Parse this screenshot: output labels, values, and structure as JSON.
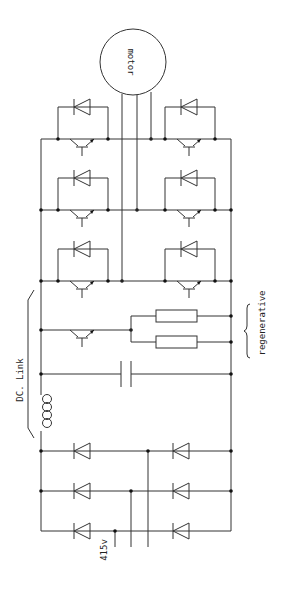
{
  "diagram": {
    "labels": {
      "motor": "motor",
      "dc_link": "DC. Link",
      "regenerative": "regenerative",
      "supply": "415v"
    },
    "colors": {
      "line": "#333333",
      "junction": "#111111",
      "background": "#ffffff"
    },
    "sections": [
      {
        "name": "rectifier",
        "components": [
          "6 diodes (3-phase bridge)"
        ]
      },
      {
        "name": "dc-link",
        "components": [
          "inductor",
          "capacitor"
        ]
      },
      {
        "name": "regenerative-braking",
        "components": [
          "brake transistor",
          "2 resistors (parallel)"
        ]
      },
      {
        "name": "inverter",
        "components": [
          "6 transistors",
          "6 freewheel diodes"
        ]
      },
      {
        "name": "load",
        "components": [
          "motor (3 leads)"
        ]
      }
    ]
  }
}
